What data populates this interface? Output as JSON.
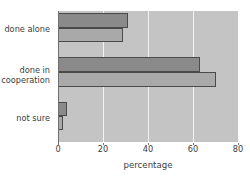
{
  "chart_data": {
    "type": "bar",
    "orientation": "horizontal",
    "title": "",
    "xlabel": "percentage",
    "ylabel": "",
    "categories": [
      "done alone",
      "done in cooperation",
      "not sure"
    ],
    "category_lines": [
      [
        "done alone"
      ],
      [
        "done in",
        "cooperation"
      ],
      [
        "not sure"
      ]
    ],
    "series": [
      {
        "name": "series-a",
        "color": "#8a8a8a",
        "values": [
          31,
          63,
          4
        ]
      },
      {
        "name": "series-b",
        "color": "#a9a9a9",
        "values": [
          29,
          70,
          2
        ]
      }
    ],
    "xlim": [
      0,
      80
    ],
    "xticks": [
      0,
      20,
      40,
      60,
      80
    ],
    "xtick_labels": [
      "0",
      "20",
      "40",
      "60",
      "80"
    ],
    "grid": true,
    "grid_axis": "x",
    "grid_color": "#f2f2f2",
    "legend": false,
    "plot_background": "#c4c4c4",
    "figure_background": "#ffffff",
    "bar_edge_color": "#4a4a4a"
  },
  "axis": {
    "x_label_text": "percentage",
    "tick_0": "0",
    "tick_1": "20",
    "tick_2": "40",
    "tick_3": "60",
    "tick_4": "80"
  },
  "categories": {
    "c0_l0": "done alone",
    "c1_l0": "done in",
    "c1_l1": "cooperation",
    "c2_l0": "not sure"
  }
}
